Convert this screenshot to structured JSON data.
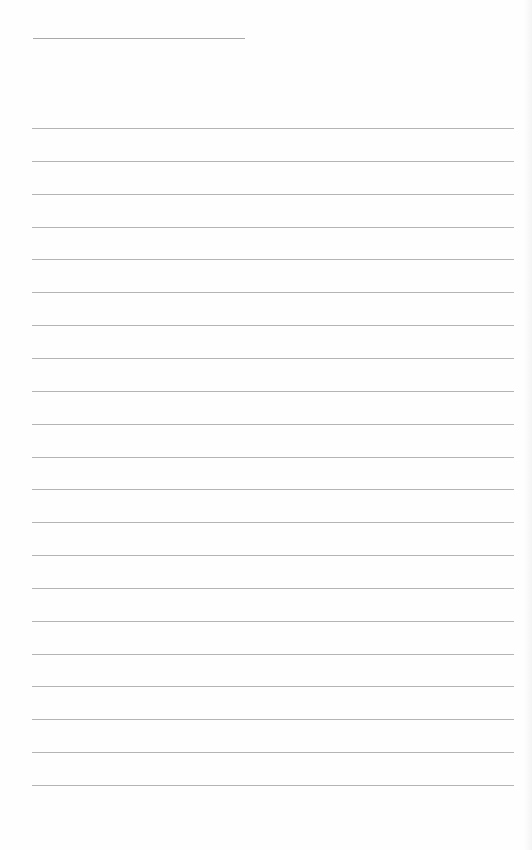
{
  "page": {
    "type": "lined-paper",
    "background": "#fefefe",
    "line_color": "#b4b4b4",
    "title_line": {
      "x": 33,
      "y": 38,
      "width": 212
    },
    "rule_count": 21,
    "rule_start_y": 128,
    "rule_spacing": 32.85,
    "rule_x": 32,
    "rule_width": 482
  }
}
